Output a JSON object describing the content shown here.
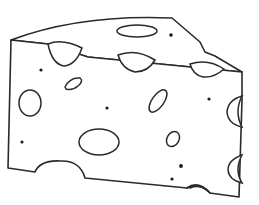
{
  "illustration": {
    "subject": "cheese-wedge",
    "style": "black line drawing on white background",
    "colors": {
      "background": "#ffffff",
      "line": "#2a2a2a",
      "dot": "#1a1a1a"
    },
    "features": {
      "holes_top_face": 1,
      "holes_on_edge": 3,
      "holes_front_face": 6,
      "side_notches": 2,
      "bottom_notches": 2,
      "dots": 7
    }
  }
}
